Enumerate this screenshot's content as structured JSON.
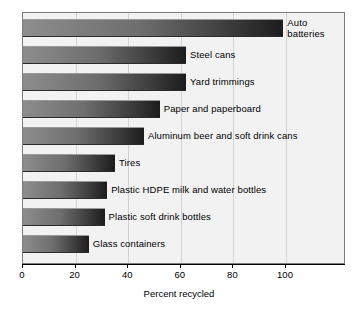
{
  "chart_data": {
    "type": "bar",
    "orientation": "horizontal",
    "title": "",
    "xlabel": "Percent recycled",
    "ylabel": "",
    "xlim": [
      0,
      123
    ],
    "xticks": [
      0,
      20,
      40,
      60,
      80,
      100
    ],
    "grid": true,
    "legend": "none",
    "categories": [
      "Auto batteries",
      "Steel cans",
      "Yard trimmings",
      "Paper and paperboard",
      "Aluminum beer and soft drink cans",
      "Tires",
      "Plastic HDPE milk and water bottles",
      "Plastic soft drink bottles",
      "Glass containers"
    ],
    "values": [
      99,
      62,
      62,
      52,
      46,
      35,
      32,
      31,
      25
    ],
    "bars": [
      {
        "label": "Auto batteries",
        "label_lines": [
          "Auto",
          "batteries"
        ],
        "value": 99
      },
      {
        "label": "Steel cans",
        "label_lines": [
          "Steel cans"
        ],
        "value": 62
      },
      {
        "label": "Yard trimmings",
        "label_lines": [
          "Yard trimmings"
        ],
        "value": 62
      },
      {
        "label": "Paper and paperboard",
        "label_lines": [
          "Paper and paperboard"
        ],
        "value": 52
      },
      {
        "label": "Aluminum beer and soft drink cans",
        "label_lines": [
          "Aluminum beer and soft drink cans"
        ],
        "value": 46
      },
      {
        "label": "Tires",
        "label_lines": [
          "Tires"
        ],
        "value": 35
      },
      {
        "label": "Plastic HDPE milk and water bottles",
        "label_lines": [
          "Plastic HDPE milk and water bottles"
        ],
        "value": 32
      },
      {
        "label": "Plastic soft drink bottles",
        "label_lines": [
          "Plastic soft drink bottles"
        ],
        "value": 31
      },
      {
        "label": "Glass containers",
        "label_lines": [
          "Glass containers"
        ],
        "value": 25
      }
    ]
  },
  "colors": {
    "bar_light": "#8d8d8d",
    "bar_dark": "#1c1c1c",
    "plot_background": "#f2f2f2",
    "gridline": "#d2d2d2",
    "frame": "#7c7c7c",
    "axis": "#000000",
    "text": "#000000",
    "page_background": "#ffffff"
  },
  "tick_labels": [
    "0",
    "20",
    "40",
    "60",
    "80",
    "100"
  ]
}
